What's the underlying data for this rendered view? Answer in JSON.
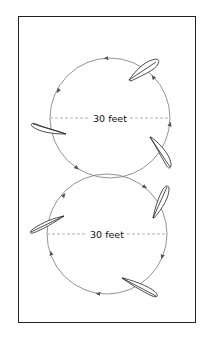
{
  "diagram": {
    "type": "figure-eight walking pattern",
    "circles": [
      {
        "id": "top",
        "center": [
          110,
          118
        ],
        "radius": 60,
        "diameter_label": "30 feet",
        "direction": "counterclockwise",
        "leaves": [
          {
            "position": "upper-right",
            "x": 148,
            "y": 70
          },
          {
            "position": "left",
            "x": 45,
            "y": 125
          },
          {
            "position": "lower-right",
            "x": 160,
            "y": 152
          }
        ]
      },
      {
        "id": "bottom",
        "center": [
          107,
          234
        ],
        "radius": 60,
        "diameter_label": "30 feet",
        "direction": "clockwise",
        "leaves": [
          {
            "position": "upper-right",
            "x": 160,
            "y": 205
          },
          {
            "position": "left",
            "x": 45,
            "y": 225
          },
          {
            "position": "lower-right",
            "x": 145,
            "y": 290
          }
        ]
      }
    ],
    "colors": {
      "frame": "#222222",
      "circle_stroke": "#777777",
      "dash_line": "#999999",
      "leaf_stroke": "#222222",
      "text": "#111111"
    }
  }
}
